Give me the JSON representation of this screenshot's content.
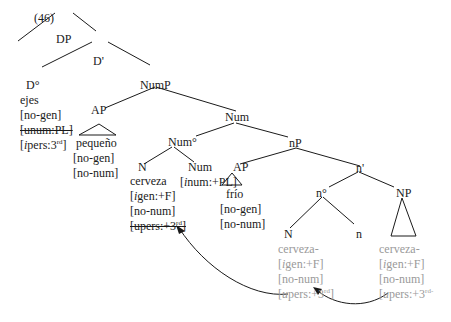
{
  "example_number": "(46)",
  "nodes": {
    "DP": "DP",
    "Dbar": "D'",
    "D0": "D°",
    "NumP": "NumP",
    "AP1": "AP",
    "Num_bar": "Num",
    "Num0": "Num°",
    "nP": "nP",
    "N1": "N",
    "Num_head": "Num",
    "AP2": "AP",
    "nbar": "n'",
    "n0": "n°",
    "NP": "NP",
    "N2": "N",
    "n_head": "n"
  },
  "leaves": {
    "D": {
      "word": "ejes",
      "f1": "[no-gen]",
      "f2": "[unum:PL]",
      "f3_pre": "[",
      "f3_i": "i",
      "f3_post": "pers:3",
      "f3_sup": "rd",
      "f3_end": "]"
    },
    "AP1": {
      "word": "pequeño",
      "f1": "[no-gen]",
      "f2": "[no-num]"
    },
    "N1": {
      "word": "cerveza",
      "f1_pre": "[",
      "f1_i": "i",
      "f1_post": "gen:+F]",
      "f2": "[no-num]",
      "f3": "[upers:+3",
      "f3_sup": "rd",
      "f3_end": "]"
    },
    "Num_head": {
      "pre": "[",
      "i": "i",
      "post": "num:+PL]"
    },
    "AP2": {
      "word": "frío",
      "f1": "[no-gen]",
      "f2": "[no-num]"
    },
    "N2": {
      "word": "cerveza-",
      "f1_pre": "[",
      "f1_i": "i",
      "f1_post": "gen:+F]",
      "f2": "[no-num]",
      "f3_pre": "[",
      "f3_u": "u",
      "f3_post": "pers:+3",
      "f3_sup": "rd",
      "f3_end": "]"
    },
    "NP": {
      "word": "cerveza-",
      "f1_pre": "[",
      "f1_i": "i",
      "f1_post": "gen:+F]",
      "f2": "[no-num]",
      "f3_pre": "[",
      "f3_u": "u",
      "f3_post": "pers:+3",
      "f3_sup": "rd-"
    }
  },
  "colors": {
    "tree": "#1a1a1a",
    "copy": "#9a9a9a"
  }
}
